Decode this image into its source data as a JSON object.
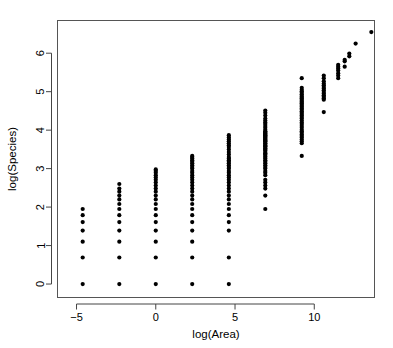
{
  "chart_data": {
    "type": "scatter",
    "title": "",
    "subtitle": "",
    "xlabel": "log(Area)",
    "ylabel": "log(Species)",
    "xlim": [
      -6.2,
      13.8
    ],
    "ylim": [
      -0.35,
      6.85
    ],
    "xticks": [
      -5,
      0,
      5,
      10
    ],
    "xtick_labels": [
      "−5",
      "0",
      "5",
      "10"
    ],
    "yticks": [
      0,
      1,
      2,
      3,
      4,
      5,
      6
    ],
    "ytick_labels": [
      "0",
      "1",
      "2",
      "3",
      "4",
      "5",
      "6"
    ],
    "grid": false,
    "legend": null,
    "marker": "filled-circle",
    "marker_color": "#000000",
    "marker_size": 2.1,
    "series": [
      {
        "name": "observations",
        "points": [
          [
            -4.61,
            0.0
          ],
          [
            -4.61,
            0.69
          ],
          [
            -4.61,
            1.1
          ],
          [
            -4.61,
            1.39
          ],
          [
            -4.61,
            1.61
          ],
          [
            -4.61,
            1.79
          ],
          [
            -4.61,
            1.95
          ],
          [
            -2.3,
            0.0
          ],
          [
            -2.3,
            0.69
          ],
          [
            -2.3,
            1.1
          ],
          [
            -2.3,
            1.39
          ],
          [
            -2.3,
            1.61
          ],
          [
            -2.3,
            1.79
          ],
          [
            -2.3,
            1.95
          ],
          [
            -2.3,
            2.08
          ],
          [
            -2.3,
            2.2
          ],
          [
            -2.3,
            2.3
          ],
          [
            -2.3,
            2.4
          ],
          [
            -2.3,
            2.48
          ],
          [
            -2.3,
            2.6
          ],
          [
            0.0,
            0.0
          ],
          [
            0.0,
            0.69
          ],
          [
            0.0,
            1.1
          ],
          [
            0.0,
            1.39
          ],
          [
            0.0,
            1.61
          ],
          [
            0.0,
            1.79
          ],
          [
            0.0,
            1.95
          ],
          [
            0.0,
            2.08
          ],
          [
            0.0,
            2.2
          ],
          [
            0.0,
            2.3
          ],
          [
            0.0,
            2.4
          ],
          [
            0.0,
            2.48
          ],
          [
            0.0,
            2.56
          ],
          [
            0.0,
            2.64
          ],
          [
            0.0,
            2.71
          ],
          [
            0.0,
            2.77
          ],
          [
            0.0,
            2.83
          ],
          [
            0.0,
            2.89
          ],
          [
            0.0,
            2.94
          ],
          [
            0.0,
            2.98
          ],
          [
            2.3,
            0.0
          ],
          [
            2.3,
            0.69
          ],
          [
            2.3,
            1.1
          ],
          [
            2.3,
            1.39
          ],
          [
            2.3,
            1.61
          ],
          [
            2.3,
            1.79
          ],
          [
            2.3,
            1.95
          ],
          [
            2.3,
            2.08
          ],
          [
            2.3,
            2.2
          ],
          [
            2.3,
            2.3
          ],
          [
            2.3,
            2.4
          ],
          [
            2.3,
            2.48
          ],
          [
            2.3,
            2.56
          ],
          [
            2.3,
            2.64
          ],
          [
            2.3,
            2.71
          ],
          [
            2.3,
            2.77
          ],
          [
            2.3,
            2.83
          ],
          [
            2.3,
            2.89
          ],
          [
            2.3,
            2.94
          ],
          [
            2.3,
            3.0
          ],
          [
            2.3,
            3.04
          ],
          [
            2.3,
            3.09
          ],
          [
            2.3,
            3.14
          ],
          [
            2.3,
            3.18
          ],
          [
            2.3,
            3.22
          ],
          [
            2.3,
            3.26
          ],
          [
            2.3,
            3.3
          ],
          [
            2.3,
            3.33
          ],
          [
            4.61,
            0.0
          ],
          [
            4.61,
            0.69
          ],
          [
            4.61,
            1.39
          ],
          [
            4.61,
            1.61
          ],
          [
            4.61,
            1.79
          ],
          [
            4.61,
            1.95
          ],
          [
            4.61,
            2.08
          ],
          [
            4.61,
            2.2
          ],
          [
            4.61,
            2.3
          ],
          [
            4.61,
            2.4
          ],
          [
            4.61,
            2.48
          ],
          [
            4.61,
            2.56
          ],
          [
            4.61,
            2.64
          ],
          [
            4.61,
            2.71
          ],
          [
            4.61,
            2.77
          ],
          [
            4.61,
            2.83
          ],
          [
            4.61,
            2.89
          ],
          [
            4.61,
            2.94
          ],
          [
            4.61,
            3.0
          ],
          [
            4.61,
            3.04
          ],
          [
            4.61,
            3.09
          ],
          [
            4.61,
            3.14
          ],
          [
            4.61,
            3.18
          ],
          [
            4.61,
            3.22
          ],
          [
            4.61,
            3.26
          ],
          [
            4.61,
            3.3
          ],
          [
            4.61,
            3.37
          ],
          [
            4.61,
            3.43
          ],
          [
            4.61,
            3.5
          ],
          [
            4.61,
            3.56
          ],
          [
            4.61,
            3.61
          ],
          [
            4.61,
            3.66
          ],
          [
            4.61,
            3.71
          ],
          [
            4.61,
            3.76
          ],
          [
            4.61,
            3.81
          ],
          [
            4.61,
            3.87
          ],
          [
            6.91,
            1.95
          ],
          [
            6.91,
            2.3
          ],
          [
            6.91,
            2.48
          ],
          [
            6.91,
            2.56
          ],
          [
            6.91,
            2.64
          ],
          [
            6.91,
            2.71
          ],
          [
            6.91,
            2.83
          ],
          [
            6.91,
            2.89
          ],
          [
            6.91,
            2.94
          ],
          [
            6.91,
            3.0
          ],
          [
            6.91,
            3.04
          ],
          [
            6.91,
            3.09
          ],
          [
            6.91,
            3.14
          ],
          [
            6.91,
            3.18
          ],
          [
            6.91,
            3.22
          ],
          [
            6.91,
            3.26
          ],
          [
            6.91,
            3.3
          ],
          [
            6.91,
            3.33
          ],
          [
            6.91,
            3.37
          ],
          [
            6.91,
            3.4
          ],
          [
            6.91,
            3.43
          ],
          [
            6.91,
            3.47
          ],
          [
            6.91,
            3.5
          ],
          [
            6.91,
            3.53
          ],
          [
            6.91,
            3.56
          ],
          [
            6.91,
            3.58
          ],
          [
            6.91,
            3.61
          ],
          [
            6.91,
            3.64
          ],
          [
            6.91,
            3.66
          ],
          [
            6.91,
            3.69
          ],
          [
            6.91,
            3.71
          ],
          [
            6.91,
            3.74
          ],
          [
            6.91,
            3.76
          ],
          [
            6.91,
            3.78
          ],
          [
            6.91,
            3.81
          ],
          [
            6.91,
            3.83
          ],
          [
            6.91,
            3.85
          ],
          [
            6.91,
            3.87
          ],
          [
            6.91,
            3.89
          ],
          [
            6.91,
            3.91
          ],
          [
            6.91,
            3.93
          ],
          [
            6.91,
            3.95
          ],
          [
            6.91,
            3.97
          ],
          [
            6.91,
            4.01
          ],
          [
            6.91,
            4.06
          ],
          [
            6.91,
            4.11
          ],
          [
            6.91,
            4.16
          ],
          [
            6.91,
            4.2
          ],
          [
            6.91,
            4.25
          ],
          [
            6.91,
            4.3
          ],
          [
            6.91,
            4.38
          ],
          [
            6.91,
            4.45
          ],
          [
            6.91,
            4.51
          ],
          [
            9.21,
            3.33
          ],
          [
            9.21,
            3.66
          ],
          [
            9.21,
            3.71
          ],
          [
            9.21,
            3.76
          ],
          [
            9.21,
            3.81
          ],
          [
            9.21,
            3.85
          ],
          [
            9.21,
            3.89
          ],
          [
            9.21,
            3.93
          ],
          [
            9.21,
            3.97
          ],
          [
            9.21,
            4.01
          ],
          [
            9.21,
            4.06
          ],
          [
            9.21,
            4.11
          ],
          [
            9.21,
            4.16
          ],
          [
            9.21,
            4.2
          ],
          [
            9.21,
            4.25
          ],
          [
            9.21,
            4.3
          ],
          [
            9.21,
            4.34
          ],
          [
            9.21,
            4.38
          ],
          [
            9.21,
            4.42
          ],
          [
            9.21,
            4.45
          ],
          [
            9.21,
            4.49
          ],
          [
            9.21,
            4.53
          ],
          [
            9.21,
            4.56
          ],
          [
            9.21,
            4.6
          ],
          [
            9.21,
            4.63
          ],
          [
            9.21,
            4.66
          ],
          [
            9.21,
            4.7
          ],
          [
            9.21,
            4.73
          ],
          [
            9.21,
            4.76
          ],
          [
            9.21,
            4.79
          ],
          [
            9.21,
            4.83
          ],
          [
            9.21,
            4.86
          ],
          [
            9.21,
            4.89
          ],
          [
            9.21,
            4.93
          ],
          [
            9.21,
            4.97
          ],
          [
            9.21,
            5.01
          ],
          [
            9.21,
            5.05
          ],
          [
            9.21,
            5.1
          ],
          [
            9.21,
            5.35
          ],
          [
            10.6,
            4.47
          ],
          [
            10.6,
            4.79
          ],
          [
            10.6,
            4.83
          ],
          [
            10.6,
            4.87
          ],
          [
            10.6,
            4.91
          ],
          [
            10.6,
            4.95
          ],
          [
            10.6,
            4.99
          ],
          [
            10.6,
            5.04
          ],
          [
            10.6,
            5.08
          ],
          [
            10.6,
            5.12
          ],
          [
            10.6,
            5.17
          ],
          [
            10.6,
            5.21
          ],
          [
            10.6,
            5.27
          ],
          [
            10.6,
            5.35
          ],
          [
            10.6,
            5.42
          ],
          [
            11.51,
            5.35
          ],
          [
            11.51,
            5.42
          ],
          [
            11.51,
            5.48
          ],
          [
            11.51,
            5.55
          ],
          [
            11.51,
            5.6
          ],
          [
            11.51,
            5.65
          ],
          [
            11.51,
            5.7
          ],
          [
            11.92,
            5.65
          ],
          [
            11.92,
            5.79
          ],
          [
            11.92,
            5.83
          ],
          [
            12.21,
            5.92
          ],
          [
            12.21,
            5.99
          ],
          [
            12.61,
            6.25
          ],
          [
            13.6,
            6.55
          ]
        ]
      }
    ]
  },
  "axis": {
    "x_title": "log(Area)",
    "y_title": "log(Species)"
  }
}
